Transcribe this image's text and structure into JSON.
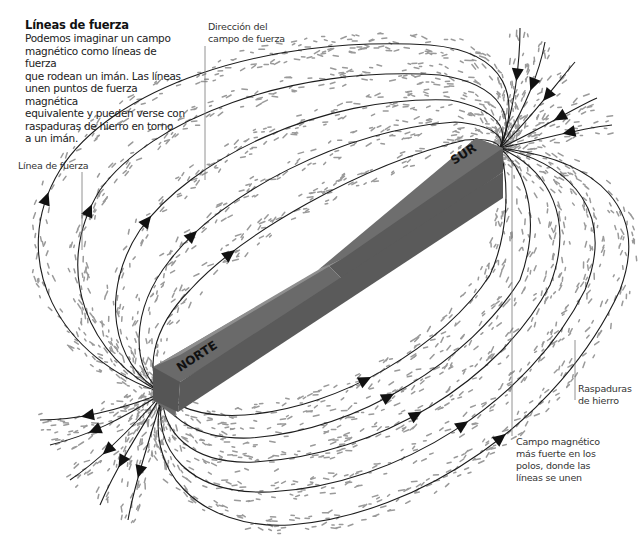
{
  "intro": {
    "title": "Líneas de fuerza",
    "body": "Podemos imaginar un campo\nmagnético como líneas de fuerza\nque rodean un imán. Las líneas\nunen puntos de fuerza magnética\nequivalente y pueden verse con\nraspaduras de hierro en torno\na un imán."
  },
  "labels": {
    "field_direction": "Dirección del\ncampo de fuerza",
    "field_line": "Línea de fuerza",
    "iron_filings": "Raspaduras\nde hierro",
    "strong_field": "Campo magnético\nmás fuerte en los\npolos, donde las\nlíneas se unen"
  },
  "magnet": {
    "north_label": "NORTE",
    "south_label": "SUR",
    "colors": {
      "top_north": "#8f8f8f",
      "top_south": "#6e6e6e",
      "side_north": "#6a6a6a",
      "side_south": "#5a5a5a",
      "end_face": "#555555"
    }
  },
  "colors": {
    "field_line": "#1c1c1c",
    "filings": "#9a9a9a",
    "background": "#ffffff"
  }
}
